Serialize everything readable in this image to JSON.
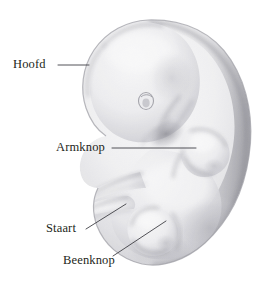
{
  "figure": {
    "background_color": "#ffffff",
    "ink_color": "#231f20",
    "shading_color": "#8d8d92",
    "leader_line_color": "#5a5a5e"
  },
  "labels": [
    {
      "id": "hoofd",
      "text": "Hoofd",
      "leader": {
        "x1": 58,
        "y1": 65,
        "x2": 89,
        "y2": 65
      },
      "target": "head"
    },
    {
      "id": "armknop",
      "text": "Armknop",
      "leader": {
        "x1": 112,
        "y1": 148,
        "x2": 196,
        "y2": 148
      },
      "target": "arm-bud"
    },
    {
      "id": "staart",
      "text": "Staart",
      "leader": {
        "x1": 86,
        "y1": 229,
        "x2": 126,
        "y2": 204
      },
      "target": "tail"
    },
    {
      "id": "beenknop",
      "text": "Beenknop",
      "leader": {
        "x1": 113,
        "y1": 256,
        "x2": 166,
        "y2": 221
      },
      "target": "leg-bud"
    }
  ],
  "anatomy": {
    "head": "Hoofd",
    "eye": "Oog",
    "arm_bud": "Armknop",
    "leg_bud": "Beenknop",
    "tail": "Staart",
    "back": "Rug"
  }
}
